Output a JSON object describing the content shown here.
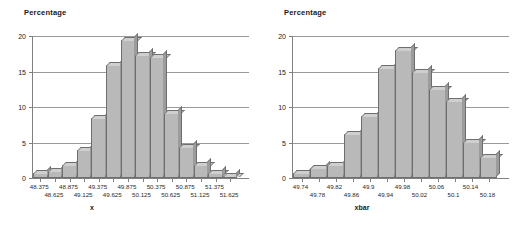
{
  "page": {
    "background_color": "#ffffff",
    "bar_fill_color": "#b9b9b9",
    "bar_edge_color": "#6e6e6e",
    "axis_color": "#808080",
    "grid_color": "#9a9a9a"
  },
  "chart_data": [
    {
      "type": "bar",
      "title": "",
      "ylabel": "Percentage",
      "xlabel": "x",
      "ylim": [
        0,
        20
      ],
      "yticks": [
        0,
        5,
        10,
        15,
        20
      ],
      "ytick_labels": [
        "0",
        "5",
        "10",
        "15",
        "20"
      ],
      "grid": true,
      "grid_axis": "y",
      "legend": "none",
      "categories": [
        "48.375",
        "48.625",
        "48.875",
        "49.125",
        "49.375",
        "49.625",
        "49.875",
        "50.125",
        "50.375",
        "50.625",
        "50.875",
        "51.125",
        "51.375",
        "51.625"
      ],
      "tick_label_rows": [
        [
          "48.375",
          "48.875",
          "49.375",
          "49.875",
          "50.375",
          "50.875",
          "51.375"
        ],
        [
          "48.625",
          "49.125",
          "49.625",
          "50.125",
          "50.625",
          "51.125",
          "51.625"
        ]
      ],
      "values": [
        0.7,
        1.0,
        1.9,
        4.0,
        8.4,
        15.9,
        19.4,
        17.3,
        17.0,
        9.2,
        4.4,
        1.8,
        0.7,
        0.3
      ]
    },
    {
      "type": "bar",
      "title": "",
      "ylabel": "Percentage",
      "xlabel": "xbar",
      "ylim": [
        0,
        20
      ],
      "yticks": [
        0,
        5,
        10,
        15,
        20
      ],
      "ytick_labels": [
        "0",
        "5",
        "10",
        "15",
        "20"
      ],
      "grid": true,
      "grid_axis": "y",
      "legend": "none",
      "categories": [
        "49.74",
        "49.78",
        "49.82",
        "49.86",
        "49.9",
        "49.94",
        "49.98",
        "50.02",
        "50.06",
        "50.1",
        "50.14",
        "50.18"
      ],
      "tick_label_rows": [
        [
          "49.74",
          "49.82",
          "49.9",
          "49.98",
          "50.06",
          "50.14"
        ],
        [
          "49.78",
          "49.86",
          "49.94",
          "50.02",
          "50.1",
          "50.18"
        ]
      ],
      "values": [
        0.7,
        1.4,
        1.8,
        6.2,
        8.7,
        15.5,
        18.0,
        15.0,
        12.5,
        10.8,
        5.1,
        3.0
      ]
    }
  ]
}
